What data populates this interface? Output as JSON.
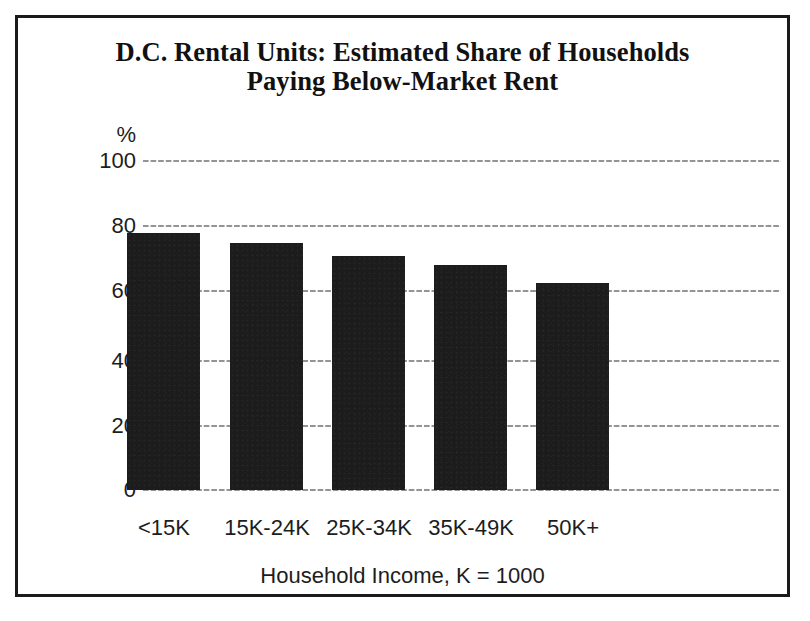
{
  "figure": {
    "title_line_1": "D.C. Rental Units: Estimated Share of Households",
    "title_line_2": "Paying Below-Market Rent",
    "border_color": "#1a1a1a",
    "background_color": "#ffffff"
  },
  "chart_data": {
    "type": "bar",
    "title": "D.C. Rental Units: Estimated Share of Households Paying Below-Market Rent",
    "categories": [
      "<15K",
      "15K-24K",
      "25K-34K",
      "35K-49K",
      "50K+"
    ],
    "values": [
      78,
      75,
      71,
      68.5,
      63
    ],
    "xlabel": "Household Income, K = 1000",
    "ylabel": "%",
    "ylim": [
      0,
      100
    ],
    "yticks": [
      0,
      20,
      40,
      60,
      80,
      100
    ],
    "ytick_labels": [
      "0",
      "20",
      "40",
      "60",
      "80",
      "100"
    ],
    "grid": "horizontal-dotted",
    "legend": "none",
    "bar_color": "#1c1c1c",
    "series": [
      {
        "name": "Estimated share paying below-market rent",
        "values": [
          78,
          75,
          71,
          68.5,
          63
        ]
      }
    ]
  }
}
